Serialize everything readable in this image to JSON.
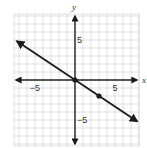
{
  "chart_data": {
    "type": "line",
    "title": "",
    "xlabel": "x",
    "ylabel": "y",
    "xlim": [
      -7.5,
      7.75
    ],
    "ylim": [
      -8.25,
      8.25
    ],
    "grid": true,
    "grid_step": 1,
    "x_tick_labels": [
      {
        "value": -5,
        "label": "−5"
      },
      {
        "value": 5,
        "label": "5"
      }
    ],
    "y_tick_labels": [
      {
        "value": 5,
        "label": "5"
      },
      {
        "value": -5,
        "label": "−5"
      }
    ],
    "series": [
      {
        "name": "line",
        "equation": "y = -2/3 x",
        "slope": -0.6667,
        "intercept": 0,
        "endpoints": [
          [
            -7.25,
            4.83
          ],
          [
            7.75,
            -5.17
          ]
        ],
        "arrows": "both"
      }
    ],
    "points": [
      {
        "x": 0,
        "y": 0
      },
      {
        "x": 3,
        "y": -2
      }
    ],
    "colors": {
      "grid": "#cfcfcf",
      "axis": "#222222",
      "line": "#1a1a1a",
      "background": "#ffffff"
    }
  }
}
